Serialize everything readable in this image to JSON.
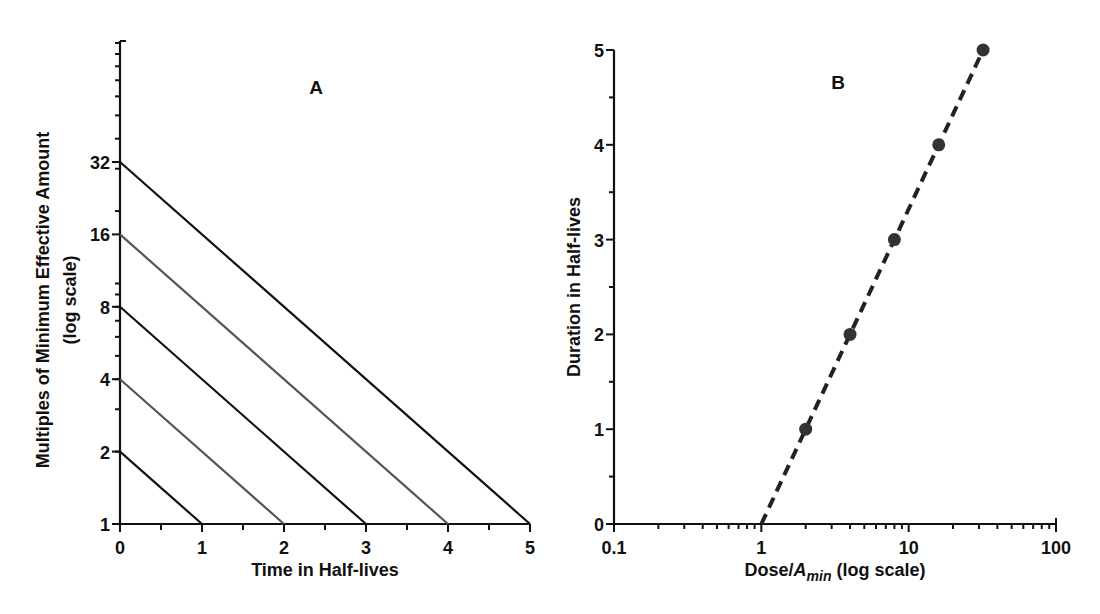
{
  "chart_data": [
    {
      "panel": "A",
      "type": "line",
      "title": "A",
      "xlabel": "Time in Half-lives",
      "ylabel": "Multiples of Minimum Effective Amount",
      "ylabel_sub": "(log scale)",
      "xlim": [
        0,
        5
      ],
      "ylim": [
        1,
        100
      ],
      "yscale": "log",
      "x_ticks": [
        0,
        1,
        2,
        3,
        4,
        5
      ],
      "y_ticks": [
        1,
        2,
        4,
        8,
        16,
        32
      ],
      "grid": false,
      "series": [
        {
          "name": "start 2",
          "x": [
            0,
            1
          ],
          "y": [
            2,
            1
          ],
          "color": "#111111"
        },
        {
          "name": "start 4",
          "x": [
            0,
            2
          ],
          "y": [
            4,
            1
          ],
          "color": "#555555"
        },
        {
          "name": "start 8",
          "x": [
            0,
            3
          ],
          "y": [
            8,
            1
          ],
          "color": "#111111"
        },
        {
          "name": "start 16",
          "x": [
            0,
            4
          ],
          "y": [
            16,
            1
          ],
          "color": "#555555"
        },
        {
          "name": "start 32",
          "x": [
            0,
            5
          ],
          "y": [
            32,
            1
          ],
          "color": "#111111"
        }
      ]
    },
    {
      "panel": "B",
      "type": "scatter",
      "title": "B",
      "xlabel_main": "Dose/",
      "xlabel_italic": "A",
      "xlabel_sub": "min",
      "xlabel_tail": " (log scale)",
      "ylabel": "Duration in Half-lives",
      "xscale": "log",
      "xlim": [
        0.1,
        100
      ],
      "ylim": [
        0,
        5
      ],
      "x_ticks": [
        0.1,
        1,
        10,
        100
      ],
      "x_tick_labels": [
        "0.1",
        "1",
        "10",
        "100"
      ],
      "y_ticks": [
        0,
        1,
        2,
        3,
        4,
        5
      ],
      "grid": false,
      "points": {
        "x": [
          2,
          4,
          8,
          16,
          32
        ],
        "y": [
          1,
          2,
          3,
          4,
          5
        ],
        "color": "#333333"
      },
      "fit_line": {
        "x": [
          1,
          32
        ],
        "y": [
          0,
          5
        ],
        "style": "dashed",
        "color": "#222222"
      }
    }
  ]
}
